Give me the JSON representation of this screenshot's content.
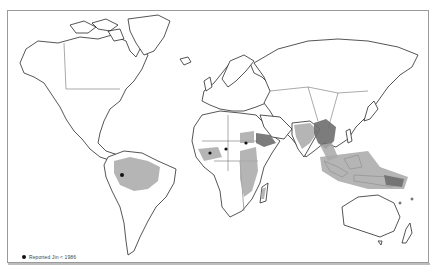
{
  "map": {
    "type": "world-distribution-map",
    "colors": {
      "background": "#ffffff",
      "coastline": "#2a2a2a",
      "endemic_area_shading": "#a8a8a8",
      "dense_area_shading": "#6e6e6e",
      "reported_case_dot": "#111111",
      "frame": "#9a9a9a"
    },
    "shaded_regions": [
      "Northern South America (Amazon basin)",
      "West Africa coast",
      "Central / East Africa",
      "Horn of Africa",
      "Madagascar",
      "Indian subcontinent",
      "Southeast Asia",
      "Indonesia / Papua New Guinea"
    ]
  },
  "legend": {
    "symbol": "filled-dot",
    "label": "Reported Jin < 1986"
  }
}
